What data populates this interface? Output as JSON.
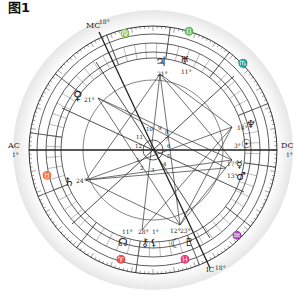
{
  "figure": {
    "caption": "图1",
    "type": "natal astrology chart wheel"
  },
  "angles": {
    "asc": {
      "label": "AC",
      "degree": "1°"
    },
    "dsc": {
      "label": "DC",
      "degree": "1°"
    },
    "mc": {
      "label": "MC",
      "degree": "18°"
    },
    "ic": {
      "label": "IC",
      "degree": "18°"
    }
  },
  "signs_visible": [
    {
      "glyph": "♍",
      "position": "top"
    },
    {
      "glyph": "♎",
      "position": "top-right"
    },
    {
      "glyph": "♏",
      "position": "right"
    },
    {
      "glyph": "♒",
      "position": "bottom-right"
    },
    {
      "glyph": "♓",
      "position": "bottom"
    },
    {
      "glyph": "♈",
      "position": "bottom-left"
    },
    {
      "glyph": "♉",
      "position": "left"
    }
  ],
  "planets": [
    {
      "name": "Jupiter",
      "glyph": "♃",
      "degree": "21°",
      "area": "top"
    },
    {
      "name": "Uranus",
      "glyph": "♅",
      "degree": "11°",
      "area": "top"
    },
    {
      "name": "Venus",
      "glyph": "♀",
      "degree": "21°",
      "area": "upper-left"
    },
    {
      "name": "Saturn",
      "glyph": "♄",
      "degree": "24°",
      "area": "left"
    },
    {
      "name": "Neptune",
      "glyph": "♆",
      "degree": "14°",
      "area": "right"
    },
    {
      "name": "Sun",
      "glyph": "☉",
      "degree": "3°",
      "area": "right"
    },
    {
      "name": "Mercury",
      "glyph": "☿",
      "degree": "17°",
      "area": "lower-right"
    },
    {
      "name": "Mars",
      "glyph": "♂",
      "degree": "13°",
      "area": "lower-right"
    },
    {
      "name": "Moon",
      "glyph": "☾",
      "degree": "12°",
      "area": "bottom-right"
    },
    {
      "name": "Pluto",
      "glyph": "♇",
      "degree": "23°",
      "area": "bottom-right"
    },
    {
      "name": "Chiron",
      "glyph": "⚷",
      "degree": "28°",
      "area": "bottom"
    },
    {
      "name": "Node",
      "glyph": "☊",
      "degree": "11°",
      "area": "bottom-left"
    },
    {
      "name": "Lilith",
      "glyph": "⚸",
      "degree": "1°",
      "area": "bottom"
    }
  ],
  "houses": [
    "1",
    "2",
    "3",
    "4",
    "5",
    "6",
    "7",
    "8",
    "9",
    "10",
    "11",
    "12"
  ]
}
